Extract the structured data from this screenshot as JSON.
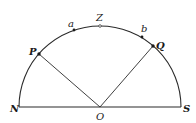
{
  "diagram": {
    "type": "semicircle-geometry",
    "center": {
      "label": "O",
      "x": 100,
      "y": 107
    },
    "radius": 81,
    "baseline": {
      "left": {
        "label": "N",
        "x": 19,
        "y": 107
      },
      "right": {
        "label": "S",
        "x": 181,
        "y": 107
      }
    },
    "points": [
      {
        "id": "Z",
        "label": "Z",
        "x": 100,
        "y": 26,
        "marker": "open"
      },
      {
        "id": "a",
        "label": "a",
        "x": 74,
        "y": 30,
        "marker": "dot"
      },
      {
        "id": "b",
        "label": "b",
        "x": 142,
        "y": 37,
        "marker": "dot"
      },
      {
        "id": "P",
        "label": "P",
        "x": 39,
        "y": 54,
        "marker": "dot"
      },
      {
        "id": "Q",
        "label": "Q",
        "x": 153,
        "y": 46,
        "marker": "dot"
      }
    ],
    "segments": [
      {
        "from": "O",
        "to": "P"
      },
      {
        "from": "O",
        "to": "Q"
      },
      {
        "from": "N",
        "to": "S"
      }
    ],
    "labels": {
      "N": "N",
      "S": "S",
      "O": "O",
      "Z": "Z",
      "a": "a",
      "b": "b",
      "P": "P",
      "Q": "Q"
    },
    "colors": {
      "line": "#2a2a2a",
      "text": "#1a1a1a",
      "background": "#ffffff"
    }
  }
}
